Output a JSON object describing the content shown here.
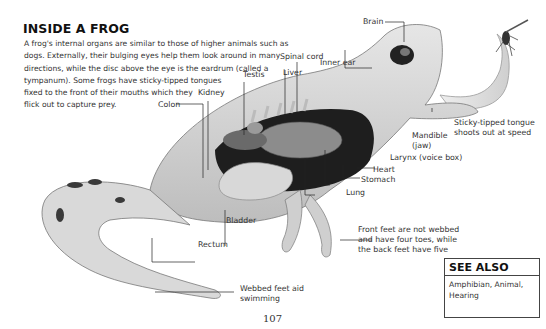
{
  "title": "INSIDE A FROG",
  "intro_lines": [
    "A frog's internal organs are similar to those of higher animals such as",
    "dogs. Externally, their bulging eyes help them look around in many",
    "directions, while the disc above the eye is the eardrum (called a",
    "tympanum). Some frogs have sticky-tipped tongues",
    "fixed to the front of their mouths which they",
    "flick out to capture prey."
  ],
  "labels": {
    "brain": "Brain",
    "spinal_cord": "Spinal cord",
    "inner_ear": "Inner ear",
    "testis": "Testis",
    "liver": "Liver",
    "kidney": "Kidney",
    "colon": "Colon",
    "mandible_1": "Mandible",
    "mandible_2": "(jaw)",
    "tongue_1": "Sticky-tipped tongue",
    "tongue_2": "shoots out at speed",
    "larynx": "Larynx (voice box)",
    "heart": "Heart",
    "stomach": "Stomach",
    "lung": "Lung",
    "bladder": "Bladder",
    "rectum": "Rectum",
    "front_feet_1": "Front feet are not webbed",
    "front_feet_2": "and have four toes, while",
    "front_feet_3": "the back feet have five",
    "webbed_1": "Webbed feet aid",
    "webbed_2": "swimming"
  },
  "see_also": {
    "heading": "SEE ALSO",
    "line1": "Amphibian, Animal,",
    "line2": "Hearing"
  },
  "page_number": "107"
}
